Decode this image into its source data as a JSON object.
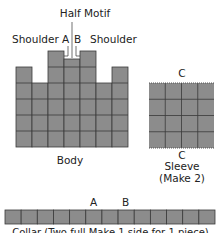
{
  "labels": {
    "half_motif": "Half Motif",
    "shoulder_left": "Shoulder",
    "shoulder_right": "Shoulder",
    "mark_a_top": "A",
    "mark_b_top": "B",
    "body": "Body",
    "sleeve_c_top": "C",
    "sleeve_c_bottom": "C",
    "sleeve": "Sleeve",
    "sleeve_note": "(Make 2)",
    "collar_a": "A",
    "collar_b": "B",
    "collar_caption": "Collar (Two full Make 1 side for 1 piece)"
  },
  "pieces": {
    "body": {
      "columns": 7,
      "column_heights_in_half_squares": [
        5,
        4,
        6,
        5.5,
        6,
        4,
        5
      ],
      "full_rows": 3
    },
    "sleeve": {
      "columns": 4,
      "rows": 4
    },
    "collar": {
      "cells": 13
    }
  },
  "colors": {
    "fill": "#8c8c8c",
    "grid": "#3a3a3a"
  }
}
